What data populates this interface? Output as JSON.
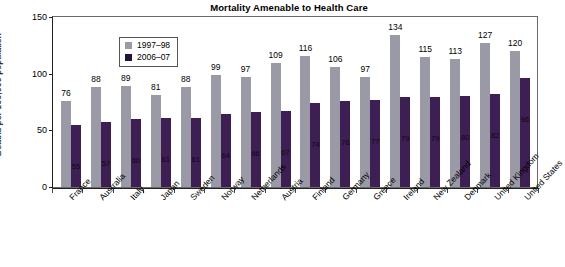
{
  "chart_data": {
    "type": "bar",
    "title": "Mortality Amenable to Health Care",
    "xlabel": "",
    "ylabel": "Deaths per 100,000 population*",
    "ylim": [
      0,
      150
    ],
    "yticks": [
      0,
      50,
      100,
      150
    ],
    "grid": false,
    "legend_position": "top-left",
    "categories": [
      "France",
      "Australia",
      "Italy",
      "Japan",
      "Sweden",
      "Norway",
      "Netherlands",
      "Austria",
      "Finland",
      "Germany",
      "Greece",
      "Ireland",
      "New Zealand",
      "Denmark",
      "United Kingdom",
      "United States"
    ],
    "series": [
      {
        "name": "1997–98",
        "color": "#9a9aa6",
        "values": [
          76,
          88,
          89,
          81,
          88,
          99,
          97,
          109,
          116,
          106,
          97,
          134,
          115,
          113,
          127,
          120
        ]
      },
      {
        "name": "2006–07",
        "color": "#3d1f54",
        "values": [
          55,
          57,
          60,
          61,
          61,
          64,
          66,
          67,
          74,
          76,
          77,
          79,
          79,
          80,
          82,
          96
        ]
      }
    ]
  },
  "legend": {
    "items": [
      {
        "label": "1997–98"
      },
      {
        "label": "2006–07"
      }
    ]
  },
  "axis": {
    "y_title": "Deaths per 100,000 population*",
    "y_ticks": [
      "150",
      "100",
      "50",
      "0"
    ]
  },
  "colors": {
    "series_old": "#9a9aa6",
    "series_new": "#3d1f54",
    "frame": "#6a6a6a",
    "text": "#000000"
  }
}
